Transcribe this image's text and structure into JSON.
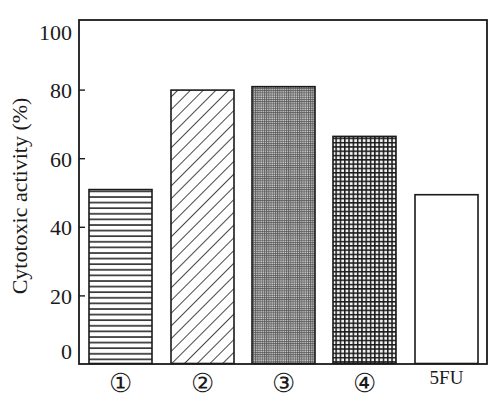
{
  "chart_data": {
    "type": "bar",
    "title": "",
    "xlabel": "",
    "ylabel": "Cytotoxic activity (%)",
    "categories": [
      "①",
      "②",
      "③",
      "④",
      "5FU"
    ],
    "values": [
      51,
      80,
      81,
      66.5,
      49.5
    ],
    "ylim": [
      0,
      100
    ],
    "yticks": [
      0,
      20,
      40,
      60,
      80,
      100
    ],
    "ytick_labels": [
      "0",
      "20",
      "40",
      "60",
      "80",
      "100"
    ],
    "grid": false,
    "legend": null,
    "bar_patterns": [
      "horizontal-lines",
      "diagonal-lines",
      "fine-grid",
      "coarse-grid",
      "none"
    ]
  },
  "colors": {
    "ink": "#1a1a1a",
    "background": "#ffffff",
    "fine_grid_fill": "#8a8a8a"
  }
}
